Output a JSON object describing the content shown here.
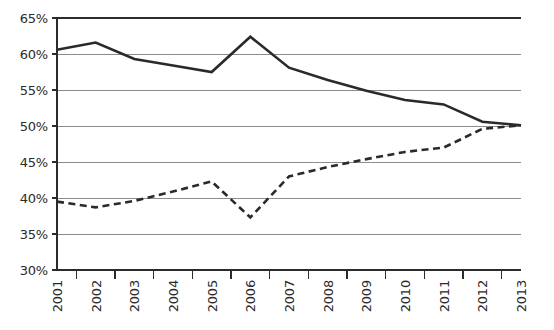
{
  "chart_data": {
    "type": "line",
    "title": "",
    "subtitle": "",
    "xlabel": "",
    "ylabel": "",
    "grid": true,
    "legend": "none",
    "categories": [
      "2001",
      "2002",
      "2003",
      "2004",
      "2005",
      "2006",
      "2007",
      "2008",
      "2009",
      "2010",
      "2011",
      "2012",
      "2013"
    ],
    "x": [
      2001,
      2002,
      2003,
      2004,
      2005,
      2006,
      2007,
      2008,
      2009,
      2010,
      2011,
      2012,
      2013
    ],
    "ylim": [
      30,
      65
    ],
    "yticks": [
      30,
      35,
      40,
      45,
      50,
      55,
      60,
      65
    ],
    "ytick_labels": [
      "30%",
      "35%",
      "40%",
      "45%",
      "50%",
      "55%",
      "60%",
      "65%"
    ],
    "xlim": [
      2001,
      2013
    ],
    "series": [
      {
        "name": "solid-series",
        "style": "solid",
        "color": "#2a2a2a",
        "width": 2.6,
        "values": [
          60.6,
          61.6,
          59.3,
          58.4,
          57.5,
          62.4,
          58.1,
          56.4,
          54.9,
          53.6,
          53.0,
          50.6,
          50.1
        ]
      },
      {
        "name": "dashed-series",
        "style": "dashed",
        "color": "#2a2a2a",
        "width": 2.6,
        "values": [
          39.5,
          38.7,
          39.6,
          40.9,
          42.3,
          37.3,
          43.0,
          44.3,
          45.4,
          46.4,
          47.0,
          49.6,
          50.1
        ]
      }
    ]
  },
  "axis": {
    "y_tick_labels": [
      "65%",
      "60%",
      "55%",
      "50%",
      "45%",
      "40%",
      "35%",
      "30%"
    ],
    "x_tick_labels": [
      "2001",
      "2002",
      "2003",
      "2004",
      "2005",
      "2006",
      "2007",
      "2008",
      "2009",
      "2010",
      "2011",
      "2012",
      "2013"
    ]
  },
  "colors": {
    "line": "#2a2a2a",
    "grid": "#8c8c8c",
    "axis": "#2b2b2b",
    "background": "#ffffff"
  }
}
